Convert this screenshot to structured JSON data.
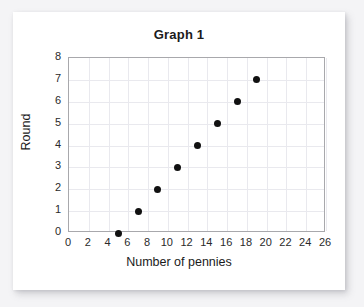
{
  "chart_data": {
    "type": "scatter",
    "title": "Graph 1",
    "xlabel": "Number of pennies",
    "ylabel": "Round",
    "xlim": [
      0,
      26
    ],
    "ylim": [
      0,
      8
    ],
    "xticks": [
      0,
      2,
      4,
      6,
      8,
      10,
      12,
      14,
      16,
      18,
      20,
      22,
      24,
      26
    ],
    "yticks": [
      0,
      1,
      2,
      3,
      4,
      5,
      6,
      7,
      8
    ],
    "xtick_labels": [
      "0",
      "2",
      "4",
      "6",
      "8",
      "10",
      "12",
      "14",
      "16",
      "18",
      "20",
      "22",
      "24",
      "26"
    ],
    "ytick_labels": [
      "0",
      "1",
      "2",
      "3",
      "4",
      "5",
      "6",
      "7",
      "8"
    ],
    "grid": true,
    "legend": false,
    "series": [
      {
        "name": "pennies-by-round",
        "marker": "filled-circle",
        "color": "#111111",
        "points": [
          {
            "x": 5,
            "y": 0
          },
          {
            "x": 7,
            "y": 1
          },
          {
            "x": 9,
            "y": 2
          },
          {
            "x": 11,
            "y": 3
          },
          {
            "x": 13,
            "y": 4
          },
          {
            "x": 15,
            "y": 5
          },
          {
            "x": 17,
            "y": 6
          },
          {
            "x": 19,
            "y": 7
          }
        ]
      }
    ]
  },
  "colors": {
    "page_background": "#f4f4f6",
    "card_background": "#ffffff",
    "plot_border": "#a8a8ac",
    "gridline": "#e9e9ee",
    "marker": "#111111",
    "text": "#1b1b1b"
  }
}
